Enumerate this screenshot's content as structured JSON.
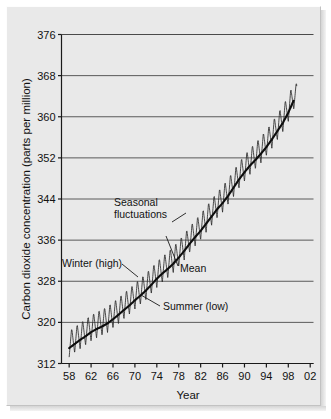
{
  "figure": {
    "background_color": "#e9e9e9",
    "page_color": "#ffffff",
    "axis_color": "#1a1a1a",
    "grid_color": "#4a4a4a",
    "series_color": "#2b2b2b",
    "mean_color": "#0d0d0d"
  },
  "chart_data": {
    "type": "line",
    "title": "",
    "subtitle": "",
    "xlabel": "Year",
    "ylabel": "Carbon dioxide concentration (parts per million)",
    "xlim": [
      56.6,
      102.6
    ],
    "ylim": [
      312,
      376
    ],
    "ytick_values": [
      312,
      320,
      328,
      336,
      344,
      352,
      360,
      368,
      376
    ],
    "ytick_labels": [
      "312",
      "320",
      "328",
      "336",
      "344",
      "352",
      "360",
      "368",
      "376"
    ],
    "xtick_values": [
      58,
      62,
      66,
      70,
      74,
      78,
      82,
      86,
      90,
      94,
      98,
      102
    ],
    "xtick_labels": [
      "58",
      "62",
      "66",
      "70",
      "74",
      "78",
      "82",
      "86",
      "90",
      "94",
      "98",
      "02"
    ],
    "grid": "horizontal",
    "legend": "none",
    "series": [
      {
        "name": "Mean",
        "style": "smooth-trend",
        "x": [
          1958,
          1959,
          1960,
          1961,
          1962,
          1963,
          1964,
          1965,
          1966,
          1967,
          1968,
          1969,
          1970,
          1971,
          1972,
          1973,
          1974,
          1975,
          1976,
          1977,
          1978,
          1979,
          1980,
          1981,
          1982,
          1983,
          1984,
          1985,
          1986,
          1987,
          1988,
          1989,
          1990,
          1991,
          1992,
          1993,
          1994,
          1995,
          1996,
          1997,
          1998,
          1999
        ],
        "values": [
          315.0,
          315.8,
          316.6,
          317.3,
          318.1,
          318.7,
          319.2,
          319.8,
          320.6,
          321.5,
          322.4,
          323.3,
          324.3,
          325.2,
          326.2,
          327.3,
          328.5,
          329.5,
          330.4,
          331.4,
          332.6,
          333.9,
          335.3,
          336.6,
          337.8,
          339.2,
          340.6,
          342.0,
          343.2,
          344.6,
          346.2,
          347.8,
          349.2,
          350.5,
          351.6,
          352.8,
          354.1,
          355.6,
          357.2,
          358.8,
          360.8,
          363.2
        ]
      },
      {
        "name": "Seasonal fluctuations",
        "style": "sawtooth-oscillation",
        "amplitude_ppm": 3.2,
        "period_years": 1,
        "description": "Annual sawtooth around the mean; winter high, summer low"
      }
    ],
    "annotations": [
      {
        "name": "seasonal-fluctuations",
        "label_lines": [
          "Seasonal",
          "fluctuations"
        ],
        "label_x_px": 114,
        "label_y_px": 206,
        "leader_from_px": [
          172,
          222
        ],
        "leader_to_px": [
          186,
          213
        ]
      },
      {
        "name": "mean",
        "label_lines": [
          "Mean"
        ],
        "label_x_px": 180,
        "label_y_px": 272,
        "leader_from_px": [
          178,
          266
        ],
        "leader_to_px": [
          166,
          236
        ]
      },
      {
        "name": "winter-high",
        "label_lines": [
          "Winter (high)"
        ],
        "label_x_px": 62,
        "label_y_px": 267,
        "leader_from_px": [
          122,
          264
        ],
        "leader_to_px": [
          138,
          277
        ]
      },
      {
        "name": "summer-low",
        "label_lines": [
          "Summer (low)"
        ],
        "label_x_px": 163,
        "label_y_px": 310,
        "leader_from_px": [
          160,
          306
        ],
        "leader_to_px": [
          141,
          295
        ]
      }
    ]
  }
}
